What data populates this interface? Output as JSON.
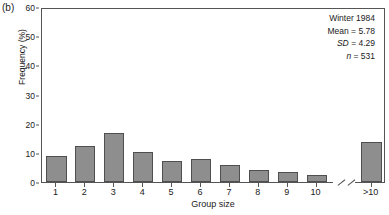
{
  "figure": {
    "panel_label": "(b)"
  },
  "annotation": {
    "season": "Winter 1984",
    "mean": "Mean = 5.78",
    "sd_symbol": "SD",
    "sd_value": " = 4.29",
    "n_symbol": "n",
    "n_value": " = 531"
  },
  "style": {
    "bar_fill": "#8e8e8e",
    "bar_stroke": "#4f4f4f",
    "axis_color": "#555555",
    "text_color": "#1a1a1a",
    "background": "#ffffff"
  },
  "chart_data": {
    "type": "bar",
    "title": "",
    "subtitle": "",
    "xlabel": "Group size",
    "ylabel": "Frequency (%)",
    "categories": [
      "1",
      "2",
      "3",
      "4",
      "5",
      "6",
      "7",
      "8",
      "9",
      "10",
      ">10"
    ],
    "values": [
      8.9,
      12.4,
      16.7,
      10.4,
      7.2,
      7.9,
      5.8,
      4.0,
      3.3,
      2.5,
      13.6
    ],
    "ylim": [
      0,
      60
    ],
    "yticks": [
      0,
      10,
      20,
      30,
      40,
      50,
      60
    ],
    "ytick_labels": [
      "0",
      "10",
      "20",
      "30",
      "40",
      "50",
      "60"
    ],
    "grid": false,
    "legend": null,
    "axis_break": {
      "present": true,
      "position_after_category": "10",
      "description": "double-slash break on x-axis between 10 and >10"
    },
    "annotations": [
      "Winter 1984",
      "Mean = 5.78",
      "SD = 4.29",
      "n = 531"
    ]
  }
}
